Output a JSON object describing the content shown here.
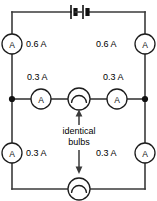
{
  "figure": {
    "background_color": "#ffffff",
    "wire_color": "#3a3a3a",
    "component_color": "#1c1c1c"
  },
  "battery": {
    "symbol_name": "battery-two-cells",
    "cell_count": 2,
    "label": ""
  },
  "ammeters": [
    {
      "id": "ammeter-top-left",
      "symbol_letter": "A",
      "reading": "0.6 A",
      "position": "top-left-rail"
    },
    {
      "id": "ammeter-top-right",
      "symbol_letter": "A",
      "reading": "0.6 A",
      "position": "top-right-rail"
    },
    {
      "id": "ammeter-middle-left",
      "symbol_letter": "A",
      "reading": "0.3 A",
      "position": "middle-branch-left"
    },
    {
      "id": "ammeter-middle-right",
      "symbol_letter": "A",
      "reading": "0.3 A",
      "position": "middle-branch-right"
    },
    {
      "id": "ammeter-bottom-left",
      "symbol_letter": "A",
      "reading": "0.3 A",
      "position": "bottom-left-rail"
    },
    {
      "id": "ammeter-bottom-right",
      "symbol_letter": "A",
      "reading": "0.3 A",
      "position": "bottom-right-rail"
    }
  ],
  "bulbs": [
    {
      "id": "bulb-middle",
      "symbol_name": "lamp-symbol"
    },
    {
      "id": "bulb-bottom",
      "symbol_name": "lamp-symbol"
    }
  ],
  "annotation": {
    "text_line_1": "identical",
    "text_line_2": "bulbs",
    "arrow_up_target": "bulb-middle",
    "arrow_down_target": "bulb-bottom"
  },
  "junctions": [
    {
      "id": "junction-left",
      "label": ""
    },
    {
      "id": "junction-right",
      "label": ""
    }
  ]
}
